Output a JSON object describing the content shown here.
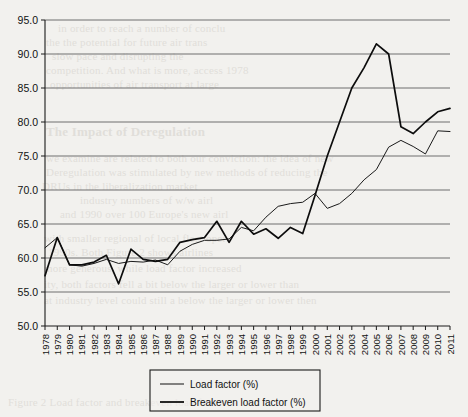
{
  "chart_data": {
    "type": "line",
    "title": "",
    "xlabel": "",
    "ylabel": "",
    "grid": true,
    "legend_position": "bottom-center",
    "ylim": [
      50.0,
      95.0
    ],
    "yticks": [
      "50.0",
      "55.0",
      "60.0",
      "65.0",
      "70.0",
      "75.0",
      "80.0",
      "85.0",
      "90.0",
      "95.0"
    ],
    "xlim": [
      1978,
      2011
    ],
    "x": [
      1978,
      1979,
      1980,
      1981,
      1982,
      1983,
      1984,
      1985,
      1986,
      1987,
      1988,
      1989,
      1990,
      1991,
      1992,
      1993,
      1994,
      1995,
      1996,
      1997,
      1998,
      1999,
      2000,
      2001,
      2002,
      2003,
      2004,
      2005,
      2006,
      2007,
      2008,
      2009,
      2010,
      2011
    ],
    "categories": [
      "1978",
      "1979",
      "1980",
      "1981",
      "1982",
      "1983",
      "1984",
      "1985",
      "1986",
      "1987",
      "1988",
      "1989",
      "1990",
      "1991",
      "1992",
      "1993",
      "1994",
      "1995",
      "1996",
      "1997",
      "1998",
      "1999",
      "2000",
      "2001",
      "2002",
      "2003",
      "2004",
      "2005",
      "2006",
      "2007",
      "2008",
      "2009",
      "2010",
      "2011"
    ],
    "series": [
      {
        "name": "Load factor (%)",
        "style": "thin",
        "values": [
          61.5,
          63.0,
          59.0,
          58.8,
          59.2,
          59.8,
          59.2,
          59.5,
          59.4,
          59.7,
          59.0,
          61.0,
          62.0,
          62.6,
          62.6,
          62.8,
          64.5,
          64.0,
          66.0,
          67.6,
          68.0,
          68.2,
          69.5,
          67.3,
          68.0,
          69.5,
          71.5,
          73.0,
          76.3,
          77.3,
          76.4,
          75.3,
          78.7,
          78.6
        ]
      },
      {
        "name": "Breakeven load factor (%)",
        "style": "thick",
        "values": [
          57.4,
          63.0,
          59.0,
          59.0,
          59.4,
          60.4,
          56.2,
          61.3,
          59.8,
          59.5,
          59.8,
          62.3,
          62.7,
          63.0,
          65.4,
          62.3,
          65.4,
          63.5,
          64.3,
          62.9,
          64.5,
          63.6,
          69.2,
          75.0,
          80.0,
          85.0,
          88.0,
          91.5,
          90.0,
          79.3,
          78.3,
          80.0,
          81.5,
          82.0
        ]
      }
    ],
    "notes": {
      "breakeven_drop_year": 2006,
      "breakeven_peak_year": 2005,
      "breakeven_peak_value": 91.5
    }
  },
  "legend": {
    "items": [
      {
        "label": "Load factor (%)",
        "style": "thin"
      },
      {
        "label": "Breakeven  load factor (%)",
        "style": "thick"
      }
    ]
  },
  "background_text": {
    "lines": [
      "in order to reach a number of conclu",
      "the the potential for future air trans",
      "slow pace and disrupting the",
      "competition. And what is more, access 1978",
      "opportunities of air transport at large",
      "The Impact of Deregulation",
      "we examine are related to both our conviction: the idea of new",
      "Deregulation was stimulated by new methods of reducing the",
      "DRUs in the liberalization market",
      "industry numbers of w/w airl",
      "and 1990 over 100 Europe's new airl",
      "with smaller regional of local fleet oper",
      "1990s. Both Figure 2 shows airlines",
      "more generous, while load factor increased",
      "ity, both factors fell a bit below the larger or lower than",
      "at industry level could still a below the larger or lower then",
      "Figure 2 Load factor and breakeven load factor"
    ]
  }
}
